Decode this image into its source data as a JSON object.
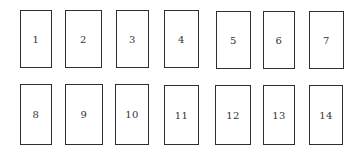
{
  "diagram": {
    "stroke_color": "#2e2e2e",
    "label_color": "#333333",
    "rows": [
      {
        "boxes": [
          {
            "label": "1",
            "x": 20,
            "y": 10,
            "w": 32,
            "h": 58
          },
          {
            "label": "2",
            "x": 65,
            "y": 10,
            "w": 37,
            "h": 58
          },
          {
            "label": "3",
            "x": 116,
            "y": 10,
            "w": 33,
            "h": 58
          },
          {
            "label": "4",
            "x": 164,
            "y": 10,
            "w": 35,
            "h": 58
          },
          {
            "label": "5",
            "x": 216,
            "y": 11,
            "w": 35,
            "h": 58
          },
          {
            "label": "6",
            "x": 263,
            "y": 11,
            "w": 32,
            "h": 58
          },
          {
            "label": "7",
            "x": 309,
            "y": 11,
            "w": 35,
            "h": 58
          }
        ]
      },
      {
        "boxes": [
          {
            "label": "8",
            "x": 20,
            "y": 84,
            "w": 32,
            "h": 61
          },
          {
            "label": "9",
            "x": 65,
            "y": 84,
            "w": 38,
            "h": 61
          },
          {
            "label": "10",
            "x": 115,
            "y": 84,
            "w": 34,
            "h": 61
          },
          {
            "label": "11",
            "x": 164,
            "y": 85,
            "w": 35,
            "h": 60
          },
          {
            "label": "12",
            "x": 215,
            "y": 85,
            "w": 36,
            "h": 60
          },
          {
            "label": "13",
            "x": 263,
            "y": 85,
            "w": 32,
            "h": 60
          },
          {
            "label": "14",
            "x": 309,
            "y": 85,
            "w": 34,
            "h": 60
          }
        ]
      }
    ]
  }
}
